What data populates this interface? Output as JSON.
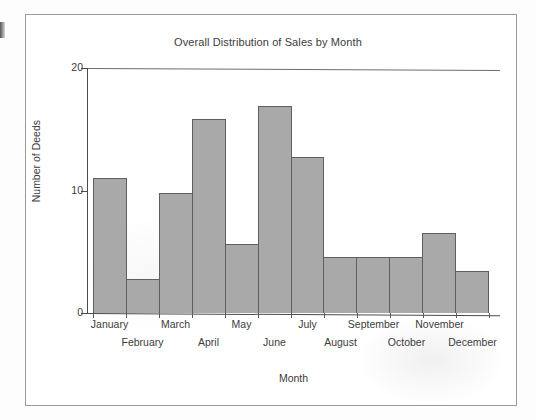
{
  "chart_data": {
    "type": "bar",
    "title": "Overall Distribution of Sales by Month",
    "xlabel": "Month",
    "ylabel": "Number of Deeds",
    "categories": [
      "January",
      "February",
      "March",
      "April",
      "May",
      "June",
      "July",
      "August",
      "September",
      "October",
      "November",
      "December"
    ],
    "values": [
      11,
      2.8,
      9.8,
      15.8,
      5.6,
      16.9,
      12.7,
      4.6,
      4.6,
      4.6,
      6.5,
      3.4
    ],
    "ylim": [
      0,
      20
    ],
    "yticks": [
      0,
      10,
      20
    ],
    "ytick_labels": [
      "0",
      "10",
      "20"
    ],
    "grid": false,
    "legend": false,
    "bar_style": "contiguous-histogram",
    "bar_fill": "#a9a9a9",
    "bar_edge": "#5f5f5f",
    "axis_color": "#4b4b4b",
    "label_layout": "staggered-two-rows"
  },
  "figure": {
    "background": "#ffffff",
    "frame_color": "#9a9a9a"
  }
}
